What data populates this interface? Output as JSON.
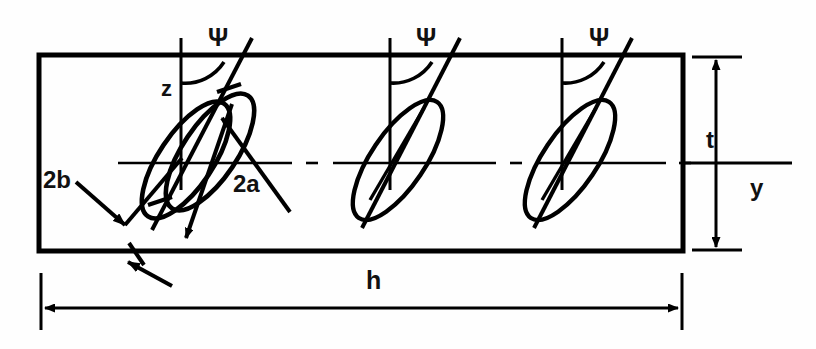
{
  "figure": {
    "type": "engineering-diagram",
    "background_color": "#fefefe",
    "line_color": "#000000"
  },
  "labels": {
    "psi_1": "Ψ",
    "psi_2": "Ψ",
    "psi_3": "Ψ",
    "z_axis": "z",
    "y_axis": "y",
    "thickness": "t",
    "width": "h",
    "major_axis": "2a",
    "minor_axis": "2b"
  },
  "geometry": {
    "plate": {
      "left": 39,
      "top": 55,
      "right": 683,
      "bottom": 251
    },
    "centerline_y": 163,
    "crack_centers_x": [
      196,
      400,
      572
    ],
    "vertical_axis_x": [
      181,
      390,
      562
    ],
    "crack_tilt_deg": 35
  },
  "annotations": {
    "thickness_dim": {
      "x": 714,
      "from_y": 57,
      "to_y": 250
    },
    "width_dim": {
      "y": 308,
      "from_x": 41,
      "to_x": 682
    },
    "y_axis_line": {
      "y": 163,
      "from_x": 683,
      "to_x": 792
    }
  }
}
